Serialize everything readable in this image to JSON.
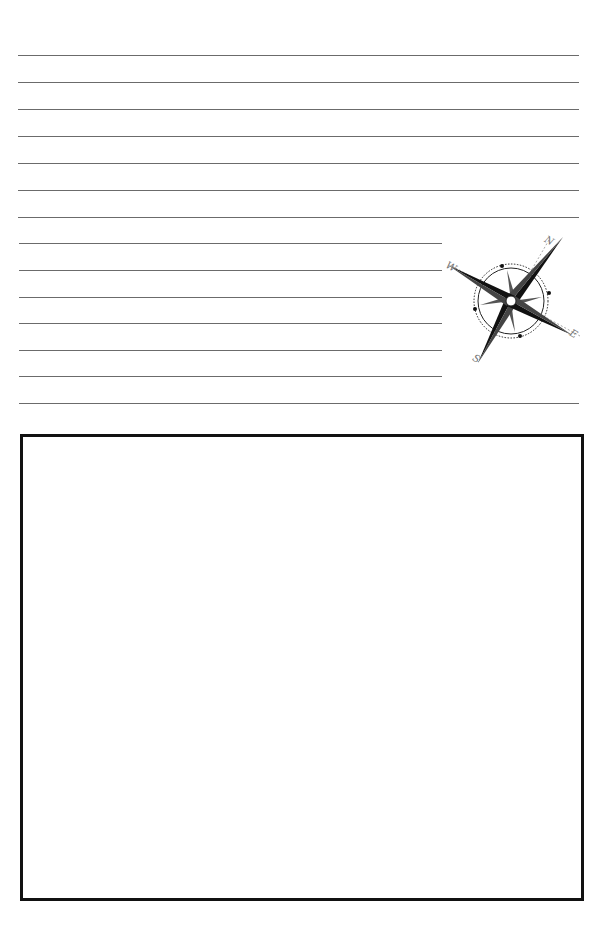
{
  "page": {
    "background": "#ffffff",
    "line_color": "#6b6b6b",
    "box_border_color": "#111111"
  },
  "lines": {
    "full_width": [
      55,
      82,
      109,
      136,
      163,
      190,
      217,
      403
    ],
    "short_width": [
      243,
      270,
      297,
      323,
      350,
      376
    ]
  },
  "compass": {
    "icon": "compass-rose-icon",
    "labels": {
      "north": "N",
      "east": "E",
      "south": "S",
      "west": "W"
    }
  },
  "drawing_box": {
    "label": ""
  }
}
